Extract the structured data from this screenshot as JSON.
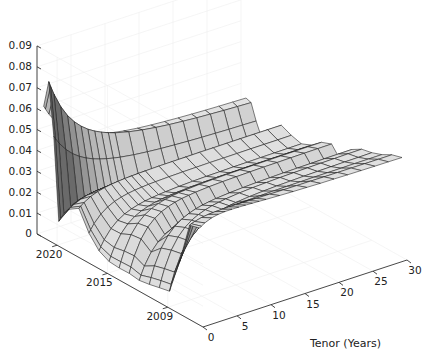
{
  "chart_data": {
    "type": "surface3d",
    "title": "",
    "xlabel": "Tenor (Years)",
    "ylabel": "",
    "zlabel": "",
    "x_axis": {
      "name": "tenor",
      "label": "Tenor (Years)",
      "range": [
        0,
        30
      ],
      "ticks": [
        0,
        5,
        10,
        15,
        20,
        25,
        30
      ],
      "tick_labels": [
        "0",
        "5",
        "10",
        "15",
        "20",
        "25",
        "30"
      ]
    },
    "y_axis": {
      "name": "date",
      "label": "",
      "range": [
        2005.5,
        2022
      ],
      "ticks": [
        2009,
        2015,
        2020
      ],
      "tick_labels": [
        "2009",
        "2015",
        "2020"
      ]
    },
    "z_axis": {
      "name": "rate",
      "label": "",
      "range": [
        0,
        0.09
      ],
      "ticks": [
        0,
        0.01,
        0.02,
        0.03,
        0.04,
        0.05,
        0.06,
        0.07,
        0.08,
        0.09
      ],
      "tick_labels": [
        "0",
        "0.01",
        "0.02",
        "0.03",
        "0.04",
        "0.05",
        "0.06",
        "0.07",
        "0.08",
        "0.09"
      ]
    },
    "grid": true,
    "legend": null,
    "colormap": "gray",
    "tenors": [
      0.25,
      0.5,
      1,
      2,
      3,
      4,
      5,
      6,
      7,
      8,
      9,
      10,
      12,
      14,
      16,
      18,
      20,
      22,
      24,
      26,
      28,
      30
    ],
    "dates": [
      2006.0,
      2007.0,
      2008.0,
      2009.0,
      2010.0,
      2011.0,
      2012.0,
      2013.0,
      2014.0,
      2015.0,
      2016.0,
      2017.0,
      2018.0,
      2019.0,
      2020.0,
      2020.5,
      2021.0,
      2021.5
    ],
    "curve_params": [
      {
        "date": 2006.0,
        "short": 0.045,
        "long": 0.047,
        "hump": 0.002
      },
      {
        "date": 2007.0,
        "short": 0.044,
        "long": 0.046,
        "hump": 0.001
      },
      {
        "date": 2008.0,
        "short": 0.022,
        "long": 0.044,
        "hump": 0.003
      },
      {
        "date": 2009.0,
        "short": 0.004,
        "long": 0.043,
        "hump": 0.004
      },
      {
        "date": 2010.0,
        "short": 0.003,
        "long": 0.042,
        "hump": 0.004
      },
      {
        "date": 2011.0,
        "short": 0.002,
        "long": 0.039,
        "hump": 0.004
      },
      {
        "date": 2012.0,
        "short": 0.002,
        "long": 0.03,
        "hump": 0.003
      },
      {
        "date": 2013.0,
        "short": 0.002,
        "long": 0.036,
        "hump": 0.004
      },
      {
        "date": 2014.0,
        "short": 0.002,
        "long": 0.034,
        "hump": 0.004
      },
      {
        "date": 2015.0,
        "short": 0.003,
        "long": 0.03,
        "hump": 0.003
      },
      {
        "date": 2016.0,
        "short": 0.006,
        "long": 0.028,
        "hump": 0.002
      },
      {
        "date": 2017.0,
        "short": 0.012,
        "long": 0.029,
        "hump": 0.002
      },
      {
        "date": 2018.0,
        "short": 0.022,
        "long": 0.031,
        "hump": 0.001
      },
      {
        "date": 2019.0,
        "short": 0.019,
        "long": 0.025,
        "hump": 0.001
      },
      {
        "date": 2020.0,
        "short": 0.01,
        "long": 0.02,
        "hump": 0.002
      },
      {
        "date": 2020.5,
        "short": 0.052,
        "long": 0.024,
        "hump": 0.0
      },
      {
        "date": 2021.0,
        "short": 0.078,
        "long": 0.03,
        "hump": 0.0
      },
      {
        "date": 2021.5,
        "short": 0.064,
        "long": 0.032,
        "hump": 0.0
      }
    ],
    "colors": {
      "face_light": "#e4e4e4",
      "face_mid": "#c8c8c8",
      "face_dark": "#6a6a6a",
      "edge": "#1a1a1a",
      "axis": "#333333",
      "grid": "#eeeeee",
      "background": "#ffffff"
    }
  }
}
